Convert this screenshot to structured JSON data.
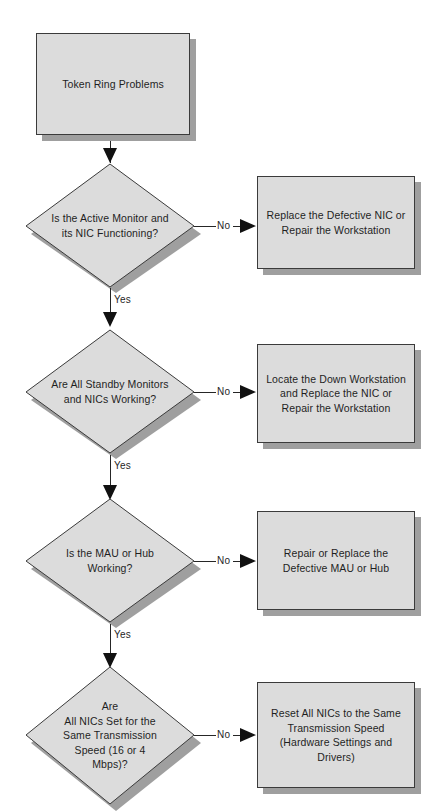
{
  "diagram": {
    "type": "flowchart",
    "colors": {
      "shape_fill": "#dcdcdc",
      "shape_border": "#3b3b3b",
      "shadow": "#8e8e8e",
      "connector": "#262626",
      "text": "#1f1f1f",
      "background": "#ffffff"
    },
    "start": {
      "id": "start",
      "shape": "process",
      "label": "Token Ring Problems"
    },
    "steps": [
      {
        "id": "step1",
        "decision": {
          "shape": "decision",
          "label": "Is the Active Monitor and\nits NIC Functioning?"
        },
        "yes_label": "Yes",
        "no_label": "No",
        "action": {
          "shape": "process",
          "label": "Replace the Defective NIC or\nRepair the Workstation"
        }
      },
      {
        "id": "step2",
        "decision": {
          "shape": "decision",
          "label": "Are All Standby Monitors\nand NICs Working?"
        },
        "yes_label": "Yes",
        "no_label": "No",
        "action": {
          "shape": "process",
          "label": "Locate the Down Workstation\nand Replace the NIC or\nRepair the Workstation"
        }
      },
      {
        "id": "step3",
        "decision": {
          "shape": "decision",
          "label": "Is the MAU or Hub\nWorking?"
        },
        "yes_label": "Yes",
        "no_label": "No",
        "action": {
          "shape": "process",
          "label": "Repair or Replace the\nDefective MAU or Hub"
        }
      },
      {
        "id": "step4",
        "decision": {
          "shape": "decision",
          "label": "Are\nAll NICs Set for the\nSame Transmission\nSpeed (16 or 4\nMbps)?"
        },
        "yes_label": "",
        "no_label": "No",
        "action": {
          "shape": "process",
          "label": "Reset All NICs to the Same\nTransmission Speed\n(Hardware Settings and\nDrivers)"
        }
      }
    ]
  }
}
